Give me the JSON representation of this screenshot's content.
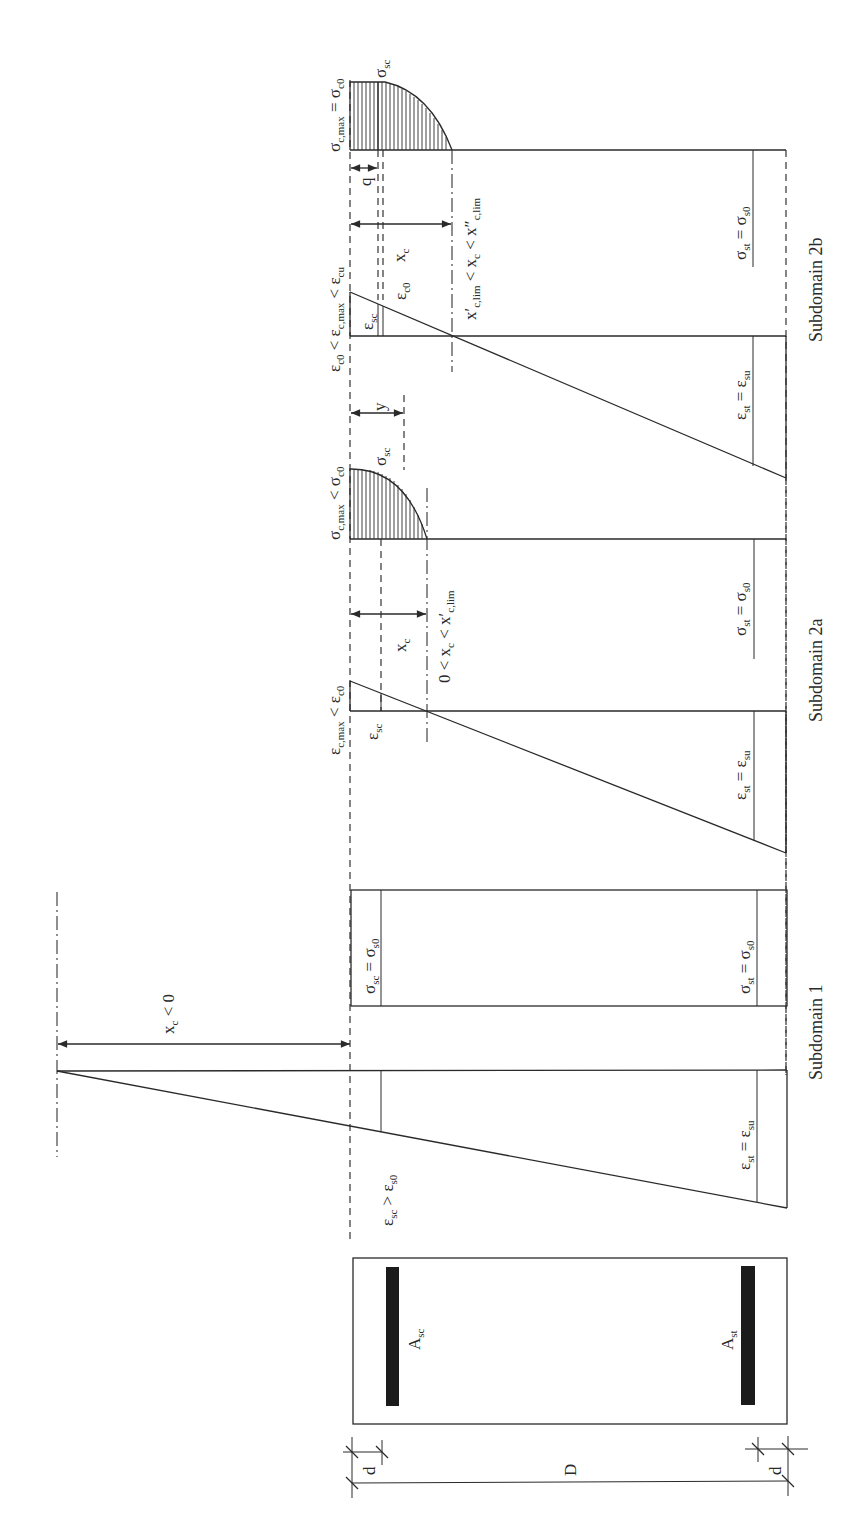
{
  "figure": {
    "orientation": "rotated-90-ccw",
    "cross_section": {
      "top_steel_label": "A",
      "top_steel_sub": "sc",
      "bottom_steel_label": "A",
      "bottom_steel_sub": "st",
      "depth_label": "D",
      "cover_top_label": "d",
      "cover_bottom_label": "d"
    },
    "subdomain_1": {
      "caption": "Subdomain 1",
      "strain_top_label": {
        "main": "ε",
        "sub": "sc",
        "rest": " > ε",
        "sub2": "s0"
      },
      "strain_bottom_label": {
        "main": "ε",
        "sub": "st",
        "rest": " = ε",
        "sub2": "su"
      },
      "stress_top_label": {
        "main": "σ",
        "sub": "sc",
        "rest": " = σ",
        "sub2": "s0"
      },
      "stress_bottom_label": {
        "main": "σ",
        "sub": "st",
        "rest": " = σ",
        "sub2": "s0"
      },
      "neutral_axis_label": {
        "main": "x",
        "sub": "c",
        "rest": " < 0"
      }
    },
    "subdomain_2a": {
      "caption": "Subdomain 2a",
      "strain_max_label": {
        "main": "ε",
        "sub": "c,max",
        "rest": " < ε",
        "sub2": "c0"
      },
      "strain_sc_label": {
        "main": "ε",
        "sub": "sc"
      },
      "strain_bottom_label": {
        "main": "ε",
        "sub": "st",
        "rest": " = ε",
        "sub2": "su"
      },
      "xc_label": {
        "main": "x",
        "sub": "c"
      },
      "range_label": {
        "pre": "0 < x",
        "sub": "c",
        "rest": " < x′",
        "sub2": "c,lim"
      },
      "stress_max_label": {
        "main": "σ",
        "sub": "c,max",
        "rest": " < σ",
        "sub2": "c0"
      },
      "stress_sc_label": {
        "main": "σ",
        "sub": "sc"
      },
      "stress_bottom_label": {
        "main": "σ",
        "sub": "st",
        "rest": " = σ",
        "sub2": "s0"
      },
      "y_label": "y"
    },
    "subdomain_2b": {
      "caption": "Subdomain 2b",
      "strain_max_label": {
        "pre": "ε",
        "pre_sub": "c0",
        "main": " < ε",
        "sub": "c,max",
        "rest": " < ε",
        "sub2": "cu"
      },
      "strain_sc_label": {
        "main": "ε",
        "sub": "sc"
      },
      "strain_c0_label": {
        "main": "ε",
        "sub": "c0"
      },
      "strain_bottom_label": {
        "main": "ε",
        "sub": "st",
        "rest": " = ε",
        "sub2": "su"
      },
      "xc_label": {
        "main": "x",
        "sub": "c"
      },
      "range_label": {
        "pre": "x′",
        "pre_sub": "c,lim",
        "main": " < x",
        "sub": "c",
        "rest": " < x″",
        "sub2": "c,lim"
      },
      "stress_max_label": {
        "main": "σ",
        "sub": "c,max",
        "rest": " = σ",
        "sub2": "c0"
      },
      "stress_sc_label": {
        "main": "σ",
        "sub": "sc"
      },
      "stress_bottom_label": {
        "main": "σ",
        "sub": "st",
        "rest": " = σ",
        "sub2": "s0"
      },
      "q_label": "q"
    }
  },
  "colors": {
    "line": "#2a2a2a",
    "bar": "#1b1b1b",
    "background": "#ffffff"
  }
}
